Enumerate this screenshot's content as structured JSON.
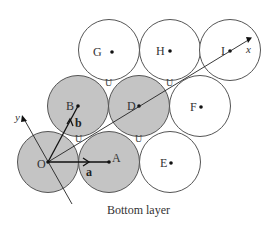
{
  "caption": "Bottom layer",
  "colors": {
    "shaded_fill": "#c4c4c4",
    "unshaded_fill": "#ffffff",
    "stroke": "#555555",
    "dot": "#111111"
  },
  "spheres": [
    {
      "label": "O",
      "shaded": true
    },
    {
      "label": "A",
      "shaded": true
    },
    {
      "label": "E",
      "shaded": false
    },
    {
      "label": "B",
      "shaded": true
    },
    {
      "label": "D",
      "shaded": true
    },
    {
      "label": "F",
      "shaded": false
    },
    {
      "label": "G",
      "shaded": false
    },
    {
      "label": "H",
      "shaded": false
    },
    {
      "label": "I",
      "shaded": false
    }
  ],
  "vectors": {
    "a": "a",
    "b": "b"
  },
  "axes": {
    "x": "x",
    "y": "y"
  },
  "void_marker": "U"
}
